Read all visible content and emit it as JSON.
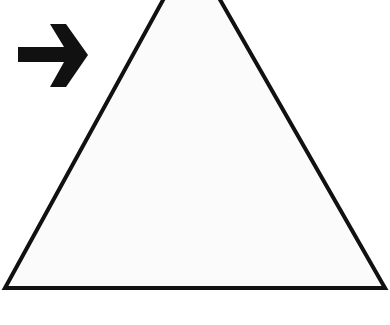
{
  "diagram": {
    "type": "shape-illustration",
    "background": "#ffffff",
    "shapes": [
      {
        "name": "triangle",
        "kind": "polygon",
        "points": [
          [
            191,
            -51
          ],
          [
            5,
            288
          ],
          [
            385,
            288
          ]
        ],
        "fill": "#fbfbfb",
        "stroke": "#111111",
        "stroke_width": 4
      },
      {
        "name": "arrow",
        "kind": "arrow",
        "direction": "right",
        "color": "#111111",
        "points": [
          [
            18,
            47
          ],
          [
            64,
            47
          ],
          [
            50,
            24
          ],
          [
            66,
            24
          ],
          [
            88,
            55
          ],
          [
            66,
            87
          ],
          [
            50,
            87
          ],
          [
            64,
            62
          ],
          [
            18,
            62
          ]
        ]
      }
    ]
  }
}
